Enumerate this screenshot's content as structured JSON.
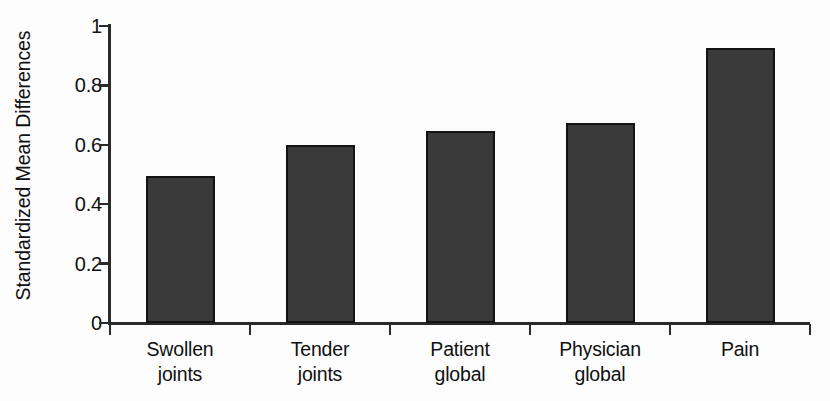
{
  "chart_data": {
    "type": "bar",
    "title": "",
    "xlabel": "",
    "ylabel": "Standardized Mean Differences",
    "categories": [
      "Swollen joints",
      "Tender joints",
      "Patient global",
      "Physician global",
      "Pain"
    ],
    "category_lines": [
      [
        "Swollen",
        "joints"
      ],
      [
        "Tender",
        "joints"
      ],
      [
        "Patient",
        "global"
      ],
      [
        "Physician",
        "global"
      ],
      [
        "Pain",
        ""
      ]
    ],
    "values": [
      0.495,
      0.6,
      0.645,
      0.675,
      0.925
    ],
    "ylim": [
      0,
      1
    ],
    "ytick_labels": [
      "1",
      "0.8",
      "0.6",
      "0.4",
      "0.2",
      "0"
    ],
    "ytick_values": [
      1,
      0.8,
      0.6,
      0.4,
      0.2,
      0
    ],
    "grid": false,
    "legend": null,
    "bar_color": "#3a3a3a",
    "bar_border_color": "#141414",
    "axis_color": "#2a2a2a",
    "background_color": "#fdfdfd",
    "text_color": "#101010"
  }
}
